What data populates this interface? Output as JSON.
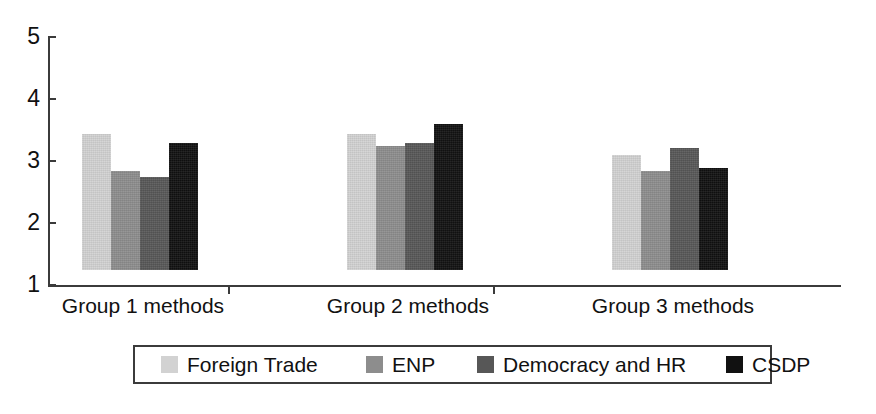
{
  "chart_data": {
    "type": "bar",
    "title": "",
    "subtitle": "",
    "xlabel": "",
    "ylabel": "",
    "categories": [
      "Group 1 methods",
      "Group 2 methods",
      "Group 3 methods"
    ],
    "series": [
      {
        "name": "Foreign Trade",
        "color": "#d2d2d2",
        "values": [
          3.2,
          3.2,
          2.85
        ]
      },
      {
        "name": "ENP",
        "color": "#8d8d8d",
        "values": [
          2.6,
          3.0,
          2.6
        ]
      },
      {
        "name": "Democracy and HR",
        "color": "#575757",
        "values": [
          2.5,
          3.05,
          2.97
        ]
      },
      {
        "name": "CSDP",
        "color": "#111111",
        "values": [
          3.05,
          3.35,
          2.65
        ]
      }
    ],
    "ylim": [
      1,
      5
    ],
    "yticks": [
      1,
      2,
      3,
      4,
      5
    ],
    "ytick_labels": [
      "1",
      "2",
      "3",
      "4",
      "5"
    ],
    "grid": false,
    "legend_position": "bottom"
  },
  "axis": {
    "y_labels": [
      "5",
      "4",
      "3",
      "2",
      "1"
    ]
  },
  "legend": {
    "items": [
      {
        "label": "Foreign Trade"
      },
      {
        "label": "ENP"
      },
      {
        "label": "Democracy and HR"
      },
      {
        "label": "CSDP"
      }
    ]
  },
  "colors": {
    "axis": "#3b3b3b",
    "text": "#111111",
    "background": "#ffffff"
  }
}
